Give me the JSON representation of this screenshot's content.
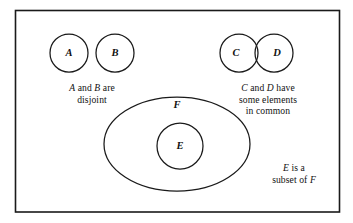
{
  "figure": {
    "border": {
      "color": "#1a1a1a",
      "style": "rectangle"
    },
    "stroke_color": "#1a1a1a",
    "background_color": "#ffffff"
  },
  "sets": {
    "a": {
      "label": "A",
      "shape": "circle",
      "cx": 69,
      "cy": 53,
      "r": 19
    },
    "b": {
      "label": "B",
      "shape": "circle",
      "cx": 115,
      "cy": 53,
      "r": 19
    },
    "c": {
      "label": "C",
      "shape": "circle",
      "cx": 239,
      "cy": 53,
      "r": 19
    },
    "d": {
      "label": "D",
      "shape": "circle",
      "cx": 274,
      "cy": 53,
      "r": 19
    },
    "e": {
      "label": "E",
      "shape": "circle",
      "cx": 180,
      "cy": 146,
      "r": 23
    },
    "f": {
      "label": "F",
      "shape": "ellipse",
      "cx": 177,
      "cy": 144,
      "rx": 73,
      "ry": 47
    }
  },
  "labels": {
    "a": "A",
    "b": "B",
    "c": "C",
    "d": "D",
    "e": "E",
    "f": "F"
  },
  "captions": {
    "ab": {
      "line1_pre": "",
      "line1_italic1": "A",
      "line1_mid": " and ",
      "line1_italic2": "B",
      "line1_post": " are",
      "line2": "disjoint",
      "plain_text": "A and B are disjoint"
    },
    "cd": {
      "line1_italic1": "C",
      "line1_mid": " and ",
      "line1_italic2": "D",
      "line1_post": " have",
      "line2": "some elements",
      "line3": "in common",
      "plain_text": "C and D have some elements in common"
    },
    "ef": {
      "line1_italic1": "E",
      "line1_post": " is a",
      "line2_pre": "subset of ",
      "line2_italic1": "F",
      "plain_text": "E is a subset of F"
    }
  }
}
